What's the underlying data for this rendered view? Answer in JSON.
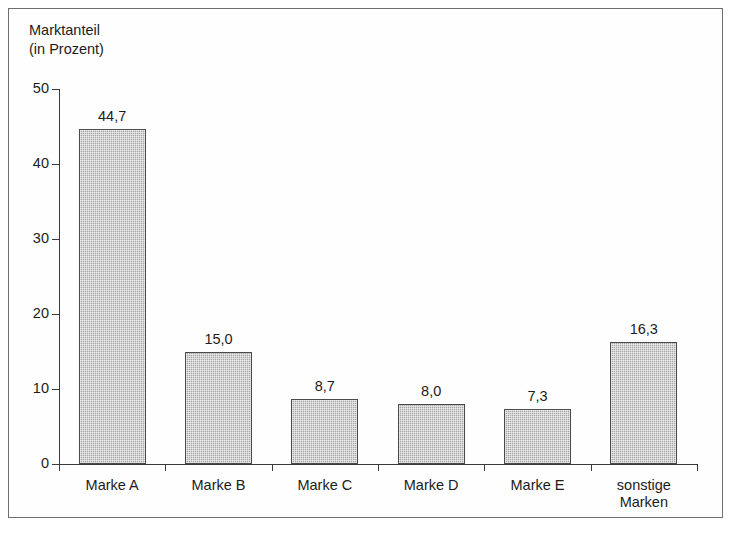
{
  "chart_data": {
    "type": "bar",
    "title": "Marktanteil\n(in Prozent)",
    "title_line1": "Marktanteil",
    "title_line2": "(in Prozent)",
    "xlabel": "",
    "ylabel": "Marktanteil (in Prozent)",
    "ylim": [
      0,
      50
    ],
    "yticks": [
      "0",
      "10",
      "20",
      "30",
      "40",
      "50"
    ],
    "ytick_values": [
      0,
      10,
      20,
      30,
      40,
      50
    ],
    "grid": false,
    "legend": false,
    "bar_color": "#b3b3b3",
    "bar_border_color": "#4a4a4a",
    "axis_color": "#3a3a3a",
    "frame_color": "#6e6e6e",
    "background": "#ffffff",
    "categories": [
      "Marke A",
      "Marke B",
      "Marke C",
      "Marke D",
      "Marke E",
      "sonstige\nMarken"
    ],
    "values": [
      44.7,
      15.0,
      8.7,
      8.0,
      7.3,
      16.3
    ],
    "value_labels": [
      "44,7",
      "15,0",
      "8,7",
      "8,0",
      "7,3",
      "16,3"
    ]
  }
}
